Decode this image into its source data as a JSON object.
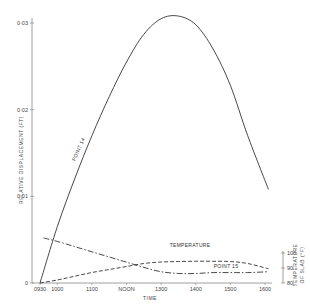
{
  "chart_data": {
    "type": "line",
    "title": "",
    "xlabel": "TIME",
    "ylabel": "RELATIVE DISPLACEMENT (FT)",
    "y2label": "TEMPERATURE OF SLAB (°F)",
    "x_ticks": [
      "0930",
      "1000",
      "1100",
      "NOON",
      "1300",
      "1400",
      "1500",
      "1600"
    ],
    "x_hours": [
      9.5,
      10,
      11,
      12,
      13,
      14,
      15,
      16
    ],
    "y_ticks": [
      "0",
      "0·01",
      "0·02",
      "0·03"
    ],
    "y_values": [
      0,
      0.01,
      0.02,
      0.03
    ],
    "y2_ticks": [
      "80",
      "90",
      "100"
    ],
    "y2_values": [
      80,
      90,
      100
    ],
    "ylim": [
      0,
      0.031
    ],
    "y2lim": [
      80,
      100
    ],
    "grid": false,
    "series": [
      {
        "name": "POINT 14",
        "style": "solid",
        "axis": "left",
        "x": [
          9.5,
          10,
          10.5,
          11,
          11.5,
          12,
          12.5,
          13,
          13.5,
          14,
          14.5,
          15,
          15.5,
          16.1
        ],
        "values": [
          0,
          0.0065,
          0.012,
          0.017,
          0.0215,
          0.0255,
          0.0287,
          0.0305,
          0.0308,
          0.0298,
          0.027,
          0.0228,
          0.017,
          0.0108
        ]
      },
      {
        "name": "TEMPERATURE",
        "style": "dashed",
        "axis": "right",
        "x": [
          9.5,
          10,
          10.5,
          11,
          11.5,
          12,
          12.5,
          13,
          13.5,
          14,
          14.5,
          15,
          15.5,
          16.1
        ],
        "values": [
          80,
          82,
          84.5,
          87,
          89,
          91,
          93,
          94,
          94.3,
          94.5,
          94.5,
          94.3,
          93,
          89.5
        ]
      },
      {
        "name": "POINT 15",
        "style": "dash-dot",
        "axis": "left",
        "x": [
          9.6,
          10,
          10.5,
          11,
          11.5,
          12,
          12.5,
          13,
          13.5,
          14,
          14.5,
          15,
          15.5,
          16.1
        ],
        "values": [
          0.0052,
          0.0048,
          0.0042,
          0.0036,
          0.003,
          0.0024,
          0.0018,
          0.0013,
          0.0011,
          0.0011,
          0.0012,
          0.0012,
          0.0012,
          0.0013
        ]
      }
    ],
    "annotations": [
      "POINT 14",
      "TEMPERATURE",
      "POINT 15"
    ]
  },
  "labels": {
    "xlabel": "TIME",
    "ylabel": "RELATIVE  DISPLACEMENT  (FT)",
    "y2label_line1": "TEMPERATURE",
    "y2label_line2": "OF SLAB  (°F)",
    "point14": "POINT 14",
    "temperature": "TEMPERATURE",
    "point15": "POINT 15"
  },
  "colors": {
    "line": "#333333",
    "axis": "#888888",
    "text": "#444444"
  }
}
